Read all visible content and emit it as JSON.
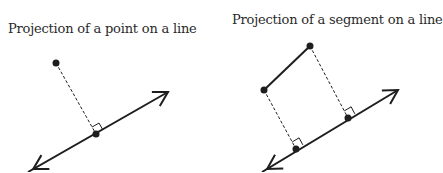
{
  "diagrams": [
    {
      "title": "Projection of a point on a line",
      "line": {
        "x1": 28,
        "y1": 172,
        "x2": 168,
        "y2": 92
      },
      "points": [
        {
          "x": 56,
          "y": 63
        }
      ],
      "feet": [
        {
          "x": 96,
          "y": 134
        }
      ]
    },
    {
      "title": "Projection of a segment on a line",
      "line": {
        "x1": 262,
        "y1": 172,
        "x2": 398,
        "y2": 90
      },
      "segment": {
        "x1": 264,
        "y1": 90,
        "x2": 310,
        "y2": 46
      },
      "points": [
        {
          "x": 264,
          "y": 90
        },
        {
          "x": 310,
          "y": 46
        }
      ],
      "feet": [
        {
          "x": 296,
          "y": 149
        },
        {
          "x": 348,
          "y": 118
        }
      ]
    }
  ],
  "colors": {
    "stroke": "#1e1e1e",
    "text": "#2a2a2a"
  }
}
